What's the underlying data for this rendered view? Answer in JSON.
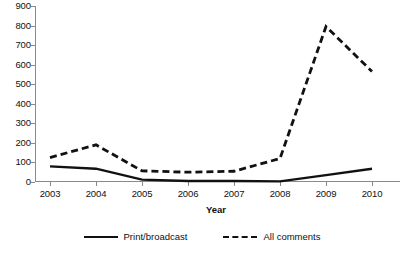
{
  "chart_data": {
    "type": "line",
    "title": "",
    "xlabel": "Year",
    "ylabel": "",
    "categories": [
      "2003",
      "2004",
      "2005",
      "2006",
      "2007",
      "2008",
      "2009",
      "2010"
    ],
    "x": [
      2003,
      2004,
      2005,
      2006,
      2007,
      2008,
      2009,
      2010
    ],
    "series": [
      {
        "name": "Print/broadcast",
        "style": "solid",
        "color": "#111111",
        "values": [
          80,
          68,
          12,
          5,
          5,
          3,
          35,
          68
        ]
      },
      {
        "name": "All comments",
        "style": "dashed",
        "color": "#111111",
        "values": [
          125,
          190,
          57,
          50,
          55,
          120,
          795,
          565
        ]
      }
    ],
    "ylim": [
      0,
      900
    ],
    "y_ticks": [
      0,
      100,
      200,
      300,
      400,
      500,
      600,
      700,
      800,
      900
    ],
    "y_tick_labels": [
      "0",
      "100",
      "200",
      "300",
      "400",
      "500",
      "600",
      "700",
      "800",
      "900"
    ],
    "grid": false,
    "legend_position": "bottom"
  },
  "axes": {
    "x_title": "Year",
    "x_tick_labels": [
      "2003",
      "2004",
      "2005",
      "2006",
      "2007",
      "2008",
      "2009",
      "2010"
    ],
    "y_tick_labels": [
      "900",
      "800",
      "700",
      "600",
      "500",
      "400",
      "300",
      "200",
      "100",
      "0"
    ]
  },
  "legend": {
    "items": [
      {
        "label": "Print/broadcast",
        "style": "solid"
      },
      {
        "label": "All comments",
        "style": "dashed"
      }
    ]
  },
  "colors": {
    "line": "#111111",
    "axis": "#8a8a8a",
    "background": "#ffffff",
    "text": "#111111"
  }
}
